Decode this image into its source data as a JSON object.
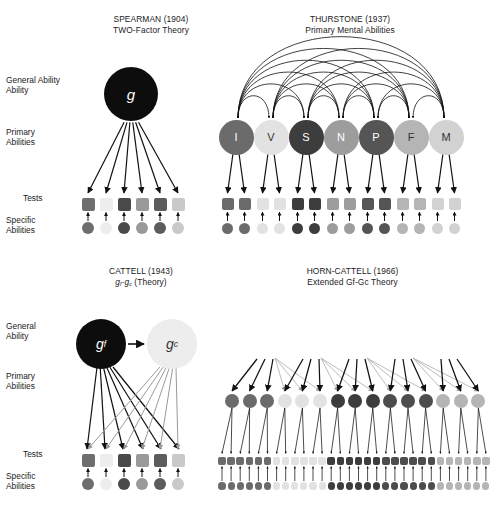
{
  "figure": {
    "caption": "Historical models of the structure of human intelligence",
    "row_labels": [
      "General Ability",
      "Primary Abilities",
      "Tests",
      "Specific Abilities"
    ]
  },
  "chart_data": {
    "type": "diagram",
    "panels": [
      {
        "id": "spearman",
        "title_line1": "SPEARMAN (1904)",
        "title_line2": "TWO-Factor Theory",
        "general": [
          {
            "label": "g",
            "shade": "#0d0d0d",
            "text": "#ffffff"
          }
        ],
        "primaries": [],
        "tests": [
          "#6e6e6e",
          "#ededed",
          "#4a4a4a",
          "#9a9a9a",
          "#5c5c5c",
          "#c9c9c9"
        ],
        "specifics": [
          "#6e6e6e",
          "#ededed",
          "#4a4a4a",
          "#9a9a9a",
          "#5c5c5c",
          "#c9c9c9"
        ]
      },
      {
        "id": "thurstone",
        "title_line1": "THURSTONE (1937)",
        "title_line2": "Primary Mental Abilities",
        "general": [],
        "primaries": [
          {
            "label": "I",
            "shade": "#6b6b6b",
            "text": "#ffffff"
          },
          {
            "label": "V",
            "shade": "#e2e2e2",
            "text": "#333333"
          },
          {
            "label": "S",
            "shade": "#3d3d3d",
            "text": "#ffffff"
          },
          {
            "label": "N",
            "shade": "#9d9d9d",
            "text": "#ffffff"
          },
          {
            "label": "P",
            "shade": "#555555",
            "text": "#ffffff"
          },
          {
            "label": "F",
            "shade": "#b5b5b5",
            "text": "#333333"
          },
          {
            "label": "M",
            "shade": "#d2d2d2",
            "text": "#333333"
          }
        ],
        "tests": [
          "#6b6b6b",
          "#6b6b6b",
          "#e2e2e2",
          "#e2e2e2",
          "#3d3d3d",
          "#3d3d3d",
          "#9d9d9d",
          "#9d9d9d",
          "#555555",
          "#555555",
          "#b5b5b5",
          "#b5b5b5",
          "#d2d2d2",
          "#d2d2d2"
        ],
        "specifics": [
          "#6b6b6b",
          "#6b6b6b",
          "#e2e2e2",
          "#e2e2e2",
          "#3d3d3d",
          "#3d3d3d",
          "#9d9d9d",
          "#9d9d9d",
          "#555555",
          "#555555",
          "#b5b5b5",
          "#b5b5b5",
          "#d2d2d2",
          "#d2d2d2"
        ]
      },
      {
        "id": "cattell",
        "title_line1": "CATTELL (1943)",
        "title_line2_pre": "g",
        "title_line2_sub1": "f",
        "title_line2_mid": "-g",
        "title_line2_sub2": "c",
        "title_line2_post": " (Theory)",
        "general": [
          {
            "label": "g",
            "sub": "f",
            "shade": "#0d0d0d",
            "text": "#ffffff"
          },
          {
            "label": "g",
            "sub": "c",
            "shade": "#ededed",
            "text": "#333333"
          }
        ],
        "primaries": [],
        "tests": [
          "#6e6e6e",
          "#ededed",
          "#4a4a4a",
          "#9a9a9a",
          "#5c5c5c",
          "#c9c9c9"
        ],
        "specifics": [
          "#6e6e6e",
          "#ededed",
          "#4a4a4a",
          "#9a9a9a",
          "#5c5c5c",
          "#c9c9c9"
        ]
      },
      {
        "id": "horn-cattell",
        "title_line1": "HORN-CATTELL (1966)",
        "title_line2": "Extended Gf-Gc Theory",
        "general": [
          {
            "label": "Gf",
            "shade": "#6b6b6b",
            "text": "#ffffff"
          },
          {
            "label": "Gc",
            "shade": "#e2e2e2",
            "text": "#333333"
          },
          {
            "label": "Gv",
            "shade": "#3d3d3d",
            "text": "#ffffff"
          },
          {
            "label": "Gs",
            "shade": "#4d4d4d",
            "text": "#ffffff"
          },
          {
            "label": "Gr",
            "shade": "#b5b5b5",
            "text": "#333333"
          }
        ],
        "primaries": [
          "#6b6b6b",
          "#6b6b6b",
          "#6b6b6b",
          "#e2e2e2",
          "#e2e2e2",
          "#e2e2e2",
          "#3d3d3d",
          "#3d3d3d",
          "#3d3d3d",
          "#4d4d4d",
          "#4d4d4d",
          "#4d4d4d",
          "#b5b5b5",
          "#b5b5b5",
          "#b5b5b5"
        ],
        "tests": [
          "#6b6b6b",
          "#6b6b6b",
          "#6b6b6b",
          "#6b6b6b",
          "#6b6b6b",
          "#6b6b6b",
          "#e2e2e2",
          "#e2e2e2",
          "#e2e2e2",
          "#e2e2e2",
          "#e2e2e2",
          "#e2e2e2",
          "#3d3d3d",
          "#3d3d3d",
          "#3d3d3d",
          "#3d3d3d",
          "#3d3d3d",
          "#3d3d3d",
          "#4d4d4d",
          "#4d4d4d",
          "#4d4d4d",
          "#4d4d4d",
          "#4d4d4d",
          "#4d4d4d",
          "#b5b5b5",
          "#b5b5b5",
          "#b5b5b5",
          "#b5b5b5",
          "#b5b5b5",
          "#b5b5b5"
        ],
        "specifics": [
          "#6b6b6b",
          "#6b6b6b",
          "#6b6b6b",
          "#6b6b6b",
          "#6b6b6b",
          "#6b6b6b",
          "#e2e2e2",
          "#e2e2e2",
          "#e2e2e2",
          "#e2e2e2",
          "#e2e2e2",
          "#e2e2e2",
          "#3d3d3d",
          "#3d3d3d",
          "#3d3d3d",
          "#3d3d3d",
          "#3d3d3d",
          "#3d3d3d",
          "#4d4d4d",
          "#4d4d4d",
          "#4d4d4d",
          "#4d4d4d",
          "#4d4d4d",
          "#4d4d4d",
          "#b5b5b5",
          "#b5b5b5",
          "#b5b5b5",
          "#b5b5b5",
          "#b5b5b5",
          "#b5b5b5"
        ]
      }
    ],
    "colors": {
      "background": "#ffffff",
      "stroke": "#111111",
      "text": "#222222"
    }
  }
}
